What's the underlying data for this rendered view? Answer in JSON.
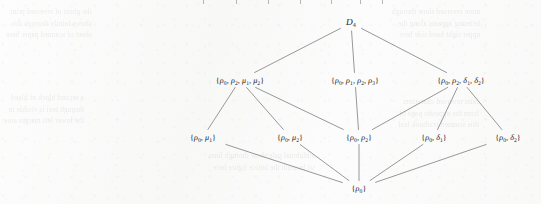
{
  "figure": {
    "kind": "subgroup-lattice-hasse-diagram",
    "group": "D4",
    "nodes": [
      {
        "id": "top",
        "label": "D₄",
        "x": 351,
        "y": 23,
        "level": 0
      },
      {
        "id": "m-left",
        "label": "{ρ₀, ρ₂, μ₁, μ₂}",
        "x": 240,
        "y": 80,
        "level": 1
      },
      {
        "id": "m-mid",
        "label": "{ρ₀, ρ₁, ρ₂, ρ₃}",
        "x": 355,
        "y": 80,
        "level": 1
      },
      {
        "id": "m-right",
        "label": "{ρ₀, ρ₂, δ₁, δ₂}",
        "x": 461,
        "y": 80,
        "level": 1
      },
      {
        "id": "b-1",
        "label": "{ρ₀, μ₁}",
        "x": 203,
        "y": 137,
        "level": 2
      },
      {
        "id": "b-2",
        "label": "{ρ₀, μ₂}",
        "x": 290,
        "y": 137,
        "level": 2
      },
      {
        "id": "b-3",
        "label": "{ρ₀, ρ₂}",
        "x": 359,
        "y": 137,
        "level": 2
      },
      {
        "id": "b-4",
        "label": "{ρ₀, δ₁}",
        "x": 434,
        "y": 137,
        "level": 2
      },
      {
        "id": "b-5",
        "label": "{ρ₀, δ₂}",
        "x": 508,
        "y": 137,
        "level": 2
      },
      {
        "id": "bottom",
        "label": "{ρ₀}",
        "x": 359,
        "y": 188,
        "level": 3
      }
    ],
    "edges": [
      {
        "from": "top",
        "to": "m-left"
      },
      {
        "from": "top",
        "to": "m-mid"
      },
      {
        "from": "top",
        "to": "m-right"
      },
      {
        "from": "m-left",
        "to": "b-1"
      },
      {
        "from": "m-left",
        "to": "b-2"
      },
      {
        "from": "m-left",
        "to": "b-3"
      },
      {
        "from": "m-mid",
        "to": "b-3"
      },
      {
        "from": "m-right",
        "to": "b-3"
      },
      {
        "from": "m-right",
        "to": "b-4"
      },
      {
        "from": "m-right",
        "to": "b-5"
      },
      {
        "from": "b-1",
        "to": "bottom"
      },
      {
        "from": "b-2",
        "to": "bottom"
      },
      {
        "from": "b-3",
        "to": "bottom"
      },
      {
        "from": "b-4",
        "to": "bottom"
      },
      {
        "from": "b-5",
        "to": "bottom"
      }
    ],
    "edge_color": "#8c8c8c",
    "text_color": "#23231f",
    "page_background": "#fbfbfb"
  },
  "background_ghost_text": {
    "left_top": "the ghost of reversed print\nshows faintly through this\nsheet of scanned paper here",
    "left_mid": "a second block of bleed\nthrough text is visible in\nthe lower left margin area",
    "right_top": "more reversed show through\nlettering appears along the\nupper right hand side here",
    "right_mid": "faint reversed characters\nfrom the opposite page of\nthis scanned textbook leaf",
    "center_mid": "additional pale show through lines\nsit beneath the lattice figure here"
  },
  "top_edge_ticks": {
    "description": "cut-off descenders from the line of text above the crop",
    "x_positions": [
      203,
      236,
      268,
      300,
      331,
      360,
      382
    ]
  }
}
